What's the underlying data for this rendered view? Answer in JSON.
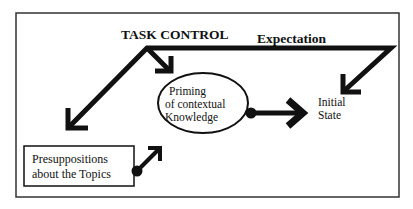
{
  "diagram": {
    "title": "TASK CONTROL",
    "expectation_label": "Expectation",
    "nodes": {
      "priming": {
        "line1": "Priming",
        "line2": "of contextual",
        "line3": "Knowledge"
      },
      "initial_state": {
        "line1": "Initial",
        "line2": "State"
      },
      "presuppositions": {
        "line1": "Presuppositions",
        "line2": "about the Topics"
      }
    },
    "edges": [
      {
        "from": "task_control",
        "to": "priming"
      },
      {
        "from": "task_control",
        "to": "lower_left"
      },
      {
        "from": "expectation",
        "to": "initial_state"
      },
      {
        "from": "priming",
        "to": "initial_state"
      },
      {
        "from": "presuppositions",
        "to": "priming"
      }
    ],
    "colors": {
      "stroke": "#111111",
      "background": "#ffffff"
    }
  }
}
